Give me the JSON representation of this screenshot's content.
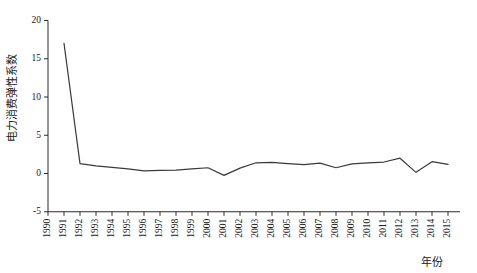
{
  "chart_data": {
    "type": "line",
    "title": "",
    "xlabel": "年份",
    "ylabel": "电力消费弹性系数",
    "x": [
      1991,
      1992,
      1993,
      1994,
      1995,
      1996,
      1997,
      1998,
      1999,
      2000,
      2001,
      2002,
      2003,
      2004,
      2005,
      2006,
      2007,
      2008,
      2009,
      2010,
      2011,
      2012,
      2013,
      2014,
      2015
    ],
    "values": [
      17.0,
      1.3,
      1.0,
      0.8,
      0.6,
      0.35,
      0.4,
      0.45,
      0.6,
      0.75,
      -0.25,
      0.7,
      1.4,
      1.45,
      1.3,
      1.15,
      1.35,
      0.75,
      1.25,
      1.4,
      1.5,
      2.0,
      0.15,
      1.55,
      1.2
    ],
    "series": [
      {
        "name": "电力消费弹性系数",
        "values": [
          17.0,
          1.3,
          1.0,
          0.8,
          0.6,
          0.35,
          0.4,
          0.45,
          0.6,
          0.75,
          -0.25,
          0.7,
          1.4,
          1.45,
          1.3,
          1.15,
          1.35,
          0.75,
          1.25,
          1.4,
          1.5,
          2.0,
          0.15,
          1.55,
          1.2
        ]
      }
    ],
    "xlim": [
      1990,
      2015
    ],
    "ylim": [
      -5,
      20
    ],
    "yticks": [
      -5,
      0,
      5,
      10,
      15,
      20
    ],
    "ytick_labels": [
      "-5",
      "0",
      "5",
      "10",
      "15",
      "20"
    ],
    "xticks": [
      1990,
      1991,
      1992,
      1993,
      1994,
      1995,
      1996,
      1997,
      1998,
      1999,
      2000,
      2001,
      2002,
      2003,
      2004,
      2005,
      2006,
      2007,
      2008,
      2009,
      2010,
      2011,
      2012,
      2013,
      2014,
      2015
    ],
    "xtick_labels": [
      "1990",
      "1991",
      "1992",
      "1993",
      "1994",
      "1995",
      "1996",
      "1997",
      "1998",
      "1999",
      "2000",
      "2001",
      "2002",
      "2003",
      "2004",
      "2005",
      "2006",
      "2007",
      "2008",
      "2009",
      "2010",
      "2011",
      "2012",
      "2013",
      "2014",
      "2015"
    ],
    "grid": false,
    "legend": "none",
    "line_color": "#3a3a3a",
    "axis_color": "#2b2b2b",
    "background": "#ffffff"
  }
}
